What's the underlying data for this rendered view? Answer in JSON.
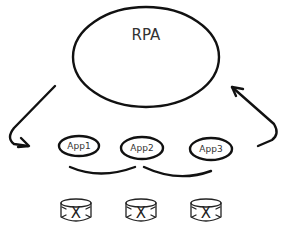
{
  "diagram": {
    "main_node": {
      "label": "RPA",
      "shape": "ellipse"
    },
    "apps": [
      {
        "label": "App1",
        "shape": "ellipse"
      },
      {
        "label": "App2",
        "shape": "ellipse"
      },
      {
        "label": "App3",
        "shape": "ellipse"
      }
    ],
    "connectors": [
      {
        "from": "RPA",
        "to": "App1",
        "type": "curved-arrow",
        "icon": "arrow-down-left-icon"
      },
      {
        "from": "App3",
        "to": "RPA",
        "type": "curved-arrow",
        "icon": "arrow-up-left-icon"
      },
      {
        "from": "App1",
        "to": "App2",
        "type": "curved-link"
      },
      {
        "from": "App2",
        "to": "App3",
        "type": "curved-link"
      }
    ],
    "databases": [
      {
        "label": "X",
        "icon": "database-icon"
      },
      {
        "label": "X",
        "icon": "database-icon"
      },
      {
        "label": "X",
        "icon": "database-icon"
      }
    ],
    "colors": {
      "stroke": "#111111",
      "text": "#333333",
      "background": "#ffffff"
    }
  }
}
